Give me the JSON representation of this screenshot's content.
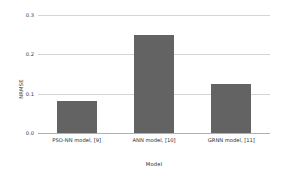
{
  "chart_data": {
    "type": "bar",
    "title": "",
    "xlabel": "Model",
    "ylabel": "NRMSE",
    "categories": [
      "PSO-NN model, [9]",
      "ANN model, [10]",
      "GRNN model, [11]"
    ],
    "values": [
      0.082,
      0.25,
      0.125
    ],
    "ylim": [
      0.0,
      0.3
    ],
    "yticks": [
      "0.0",
      "0.1",
      "0.2",
      "0.3"
    ],
    "ytick_values": [
      0.0,
      0.1,
      0.2,
      0.3
    ],
    "grid": true,
    "legend": "none",
    "bar_color": "#636363",
    "grid_color": "#d4d4d4",
    "background_color": "#ffffff"
  }
}
